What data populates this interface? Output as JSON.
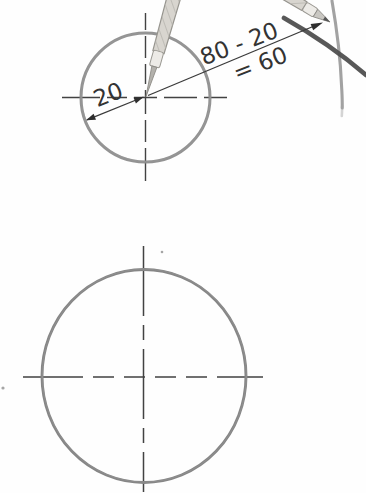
{
  "diagram": {
    "labels": {
      "small_circle_radius": "20",
      "compass_setting_formula": "80 - 20",
      "compass_setting_result": "= 60"
    },
    "colors": {
      "background": "#fefefe",
      "small_circle_stroke": "#8d8d8d",
      "large_circle_stroke": "#868686",
      "centerline": "#424242",
      "dimension_line": "#3a3a3a",
      "arrowhead": "#2e2e2e",
      "label_text": "#333333",
      "construction_arc": "#a2a2a2",
      "dark_radius_line": "#4f4f4f",
      "compass_body": "#d8d5cf",
      "compass_ferrule": "#edebe7",
      "compass_lead": "#555555"
    }
  }
}
